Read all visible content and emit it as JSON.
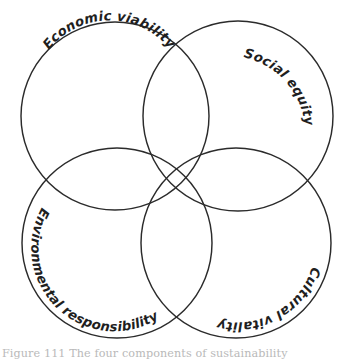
{
  "figure": {
    "type": "four-circle-venn-diagram",
    "background_color": "#ffffff",
    "stroke_color": "#2b2b2b",
    "label_color": "#1f1f1f",
    "caption": "Figure 111   The four components of sustainability",
    "circles": [
      {
        "id": "economic-viability",
        "label": "Economic viability",
        "position": "top-left",
        "cx": 115,
        "cy": 116,
        "r": 94
      },
      {
        "id": "social-equity",
        "label": "Social equity",
        "position": "top-right",
        "cx": 238,
        "cy": 116,
        "r": 95
      },
      {
        "id": "environmental-responsibility",
        "label": "Environmental responsibility",
        "position": "bottom-left",
        "cx": 117,
        "cy": 243,
        "r": 95
      },
      {
        "id": "cultural-vitality",
        "label": "Cultural vitality",
        "position": "bottom-right",
        "cx": 236,
        "cy": 243,
        "r": 95
      }
    ]
  }
}
